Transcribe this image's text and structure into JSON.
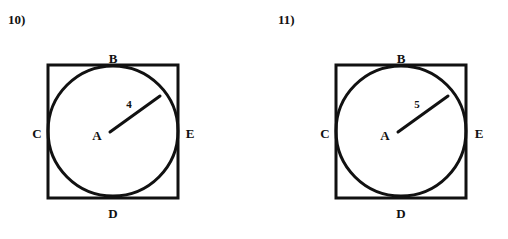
{
  "page": {
    "background_color": "#ffffff",
    "ink_color": "#111111"
  },
  "problems": [
    {
      "number_label": "10)",
      "figure": {
        "description": "circle inscribed in square",
        "square": {
          "x": 48,
          "y": 65,
          "width": 130,
          "height": 133,
          "stroke_width": 3
        },
        "circle": {
          "cx": 113,
          "cy": 131,
          "r": 65,
          "stroke_width": 3
        },
        "center_point": {
          "x": 108,
          "y": 133
        },
        "radius_line": {
          "x1": 110,
          "y1": 132,
          "x2": 160,
          "y2": 96,
          "stroke_width": 3
        },
        "radius_label": {
          "text": "4",
          "x": 129,
          "y": 104
        },
        "vertex_labels": [
          {
            "id": "B",
            "text": "B",
            "x": 113,
            "y": 58
          },
          {
            "id": "C",
            "text": "C",
            "x": 37,
            "y": 133
          },
          {
            "id": "A",
            "text": "A",
            "x": 97,
            "y": 135
          },
          {
            "id": "E",
            "text": "E",
            "x": 190,
            "y": 133
          },
          {
            "id": "D",
            "text": "D",
            "x": 113,
            "y": 213
          }
        ]
      }
    },
    {
      "number_label": "11)",
      "figure": {
        "description": "circle inscribed in square",
        "square": {
          "x": 82,
          "y": 65,
          "width": 130,
          "height": 133,
          "stroke_width": 3
        },
        "circle": {
          "cx": 147,
          "cy": 131,
          "r": 65,
          "stroke_width": 3
        },
        "center_point": {
          "x": 142,
          "y": 133
        },
        "radius_line": {
          "x1": 144,
          "y1": 132,
          "x2": 194,
          "y2": 96,
          "stroke_width": 3
        },
        "radius_label": {
          "text": "5",
          "x": 163,
          "y": 104
        },
        "vertex_labels": [
          {
            "id": "B",
            "text": "B",
            "x": 147,
            "y": 58
          },
          {
            "id": "C",
            "text": "C",
            "x": 71,
            "y": 133
          },
          {
            "id": "A",
            "text": "A",
            "x": 131,
            "y": 135
          },
          {
            "id": "E",
            "text": "E",
            "x": 225,
            "y": 133
          },
          {
            "id": "D",
            "text": "D",
            "x": 147,
            "y": 213
          }
        ]
      }
    }
  ]
}
